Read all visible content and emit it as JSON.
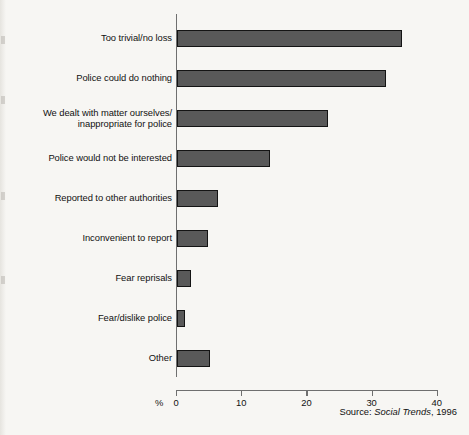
{
  "figure": {
    "source_prefix": "Source: ",
    "source_title": "Social Trends",
    "source_suffix": ", 1996",
    "percent_symbol": "%"
  },
  "colors": {
    "bar_fill": "#595959",
    "bar_stroke": "#141414",
    "axis": "#6f6f6f",
    "background": "#f7f6f3",
    "text": "#111111"
  },
  "chart_data": {
    "type": "bar",
    "orientation": "horizontal",
    "title": "",
    "xlabel": "%",
    "ylabel": "",
    "xlim": [
      0,
      40
    ],
    "xticks": [
      0,
      10,
      20,
      30,
      40
    ],
    "xtick_labels": [
      "0",
      "10",
      "20",
      "30",
      "40"
    ],
    "grid": false,
    "legend": false,
    "categories": [
      "Too trivial/no loss",
      "Police could do nothing",
      "We dealt with matter ourselves/\ninappropriate for police",
      "Police would not be interested",
      "Reported to other authorities",
      "Inconvenient to report",
      "Fear reprisals",
      "Fear/dislike police",
      "Other"
    ],
    "values": [
      34.5,
      32.0,
      23.2,
      14.2,
      6.3,
      4.8,
      2.2,
      1.3,
      5.1
    ],
    "annotations": [
      "Source: Social Trends, 1996"
    ]
  }
}
